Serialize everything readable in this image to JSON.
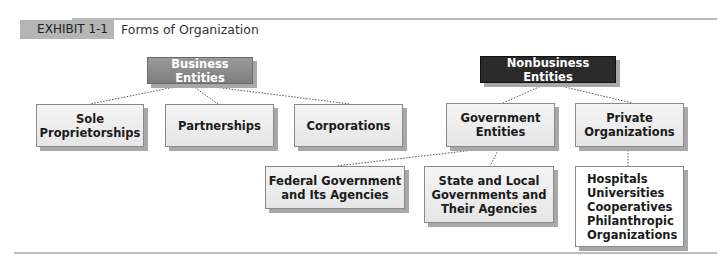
{
  "exhibit": {
    "tag": "EXHIBIT 1-1",
    "title": "Forms of Organization"
  },
  "colors": {
    "business_header": "#8c8c8c",
    "nonbusiness_header": "#2a2a2a",
    "box_fill": "#ececec",
    "rule": "#b8b8b8"
  },
  "diagram": {
    "business": {
      "label": "Business Entities",
      "children": [
        {
          "label": "Sole\nProprietorships"
        },
        {
          "label": "Partnerships"
        },
        {
          "label": "Corporations"
        }
      ]
    },
    "nonbusiness": {
      "label": "Nonbusiness Entities",
      "children": [
        {
          "label": "Government\nEntities",
          "children": [
            {
              "label": "Federal Government\nand Its Agencies"
            },
            {
              "label": "State and Local\nGovernments and\nTheir Agencies"
            }
          ]
        },
        {
          "label": "Private\nOrganizations",
          "children": [
            {
              "label": "Hospitals\nUniversities\nCooperatives\nPhilanthropic\n  Organizations"
            }
          ]
        }
      ]
    }
  }
}
